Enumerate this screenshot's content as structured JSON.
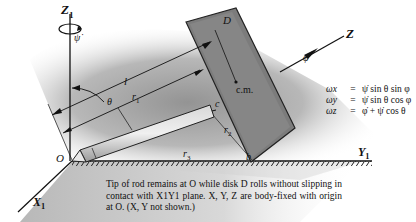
{
  "figure": {
    "axes": {
      "z1": "Z",
      "z1_sub": "1",
      "y1": "Y",
      "y1_sub": "1",
      "x1": "X",
      "x1_sub": "1",
      "z_body": "Z"
    },
    "labels": {
      "psi_dot": "ψ̇",
      "phi_dot": "φ̇",
      "disk": "D",
      "center_of_mass": "c.m.",
      "length": "l",
      "theta": "θ",
      "r1": "r",
      "r1_sub": "1",
      "r2": "r",
      "r2_sub": "2",
      "r3": "r",
      "r3_sub": "3",
      "point_c": "c",
      "point_b": "b",
      "origin": "O"
    },
    "equations": [
      {
        "lhs": "ωx",
        "op": "=",
        "rhs": "ψ̇ sin θ sin φ"
      },
      {
        "lhs": "ωy",
        "op": "=",
        "rhs": "ψ̇ sin θ cos φ"
      },
      {
        "lhs": "ωz",
        "op": "=",
        "rhs": "φ̇ + ψ̇ cos θ"
      }
    ],
    "caption": "Tip of rod remains at O while disk D rolls without slipping in contact with X1Y1 plane. X, Y, Z are body-fixed with origin at O. (X, Y not shown.)",
    "colors": {
      "shading_dark": "#8c8c8c",
      "shading_light": "#e6e6e6",
      "disk_fill": "#7a7a7a",
      "ink": "#111111"
    }
  }
}
